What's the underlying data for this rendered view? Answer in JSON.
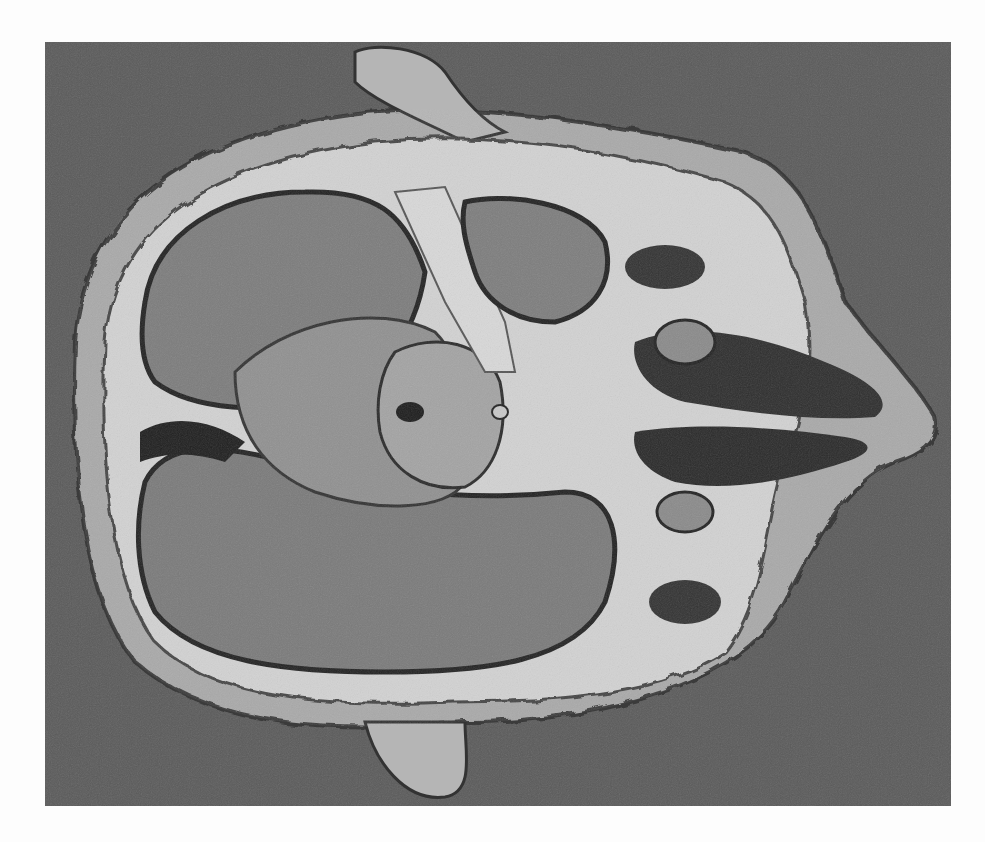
{
  "image": {
    "subject": "Horizontal cross-section of an animal head specimen on gray background",
    "alt": "Anatomical specimen: sectioned head showing brain, skull, and nasal cavity",
    "colors": {
      "page": "#fdfdfd",
      "background": "#5a5a5a",
      "skin": "#b8b8b8",
      "bone": "#d6d6d6",
      "brain": "#7a7a7a",
      "dark_cavity": "#2a2a2a"
    }
  }
}
